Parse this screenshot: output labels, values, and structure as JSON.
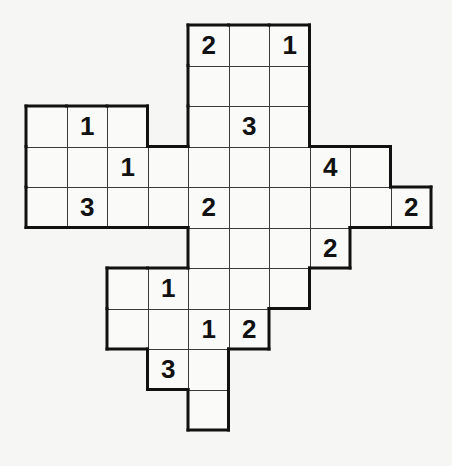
{
  "puzzle": {
    "type": "number-grid-puzzle",
    "cell_size": 40.5,
    "origin_x": 26,
    "origin_y": 25,
    "colors": {
      "background": "#f6f6f4",
      "cell": "#fafaf8",
      "grid_line": "#3a3a3a",
      "outline": "#111111",
      "digit": "#111111"
    },
    "rows": [
      {
        "row": 0,
        "cells": [
          {
            "col": 4,
            "value": "2"
          },
          {
            "col": 5,
            "value": ""
          },
          {
            "col": 6,
            "value": "1"
          }
        ]
      },
      {
        "row": 1,
        "cells": [
          {
            "col": 4,
            "value": ""
          },
          {
            "col": 5,
            "value": ""
          },
          {
            "col": 6,
            "value": ""
          }
        ]
      },
      {
        "row": 2,
        "cells": [
          {
            "col": 0,
            "value": ""
          },
          {
            "col": 1,
            "value": "1"
          },
          {
            "col": 2,
            "value": ""
          },
          {
            "col": 4,
            "value": ""
          },
          {
            "col": 5,
            "value": "3"
          },
          {
            "col": 6,
            "value": ""
          }
        ]
      },
      {
        "row": 3,
        "cells": [
          {
            "col": 0,
            "value": ""
          },
          {
            "col": 1,
            "value": ""
          },
          {
            "col": 2,
            "value": "1"
          },
          {
            "col": 3,
            "value": ""
          },
          {
            "col": 4,
            "value": ""
          },
          {
            "col": 5,
            "value": ""
          },
          {
            "col": 6,
            "value": ""
          },
          {
            "col": 7,
            "value": "4"
          },
          {
            "col": 8,
            "value": ""
          }
        ]
      },
      {
        "row": 4,
        "cells": [
          {
            "col": 0,
            "value": ""
          },
          {
            "col": 1,
            "value": "3"
          },
          {
            "col": 2,
            "value": ""
          },
          {
            "col": 3,
            "value": ""
          },
          {
            "col": 4,
            "value": "2"
          },
          {
            "col": 5,
            "value": ""
          },
          {
            "col": 6,
            "value": ""
          },
          {
            "col": 7,
            "value": ""
          },
          {
            "col": 8,
            "value": ""
          },
          {
            "col": 9,
            "value": "2"
          }
        ]
      },
      {
        "row": 5,
        "cells": [
          {
            "col": 4,
            "value": ""
          },
          {
            "col": 5,
            "value": ""
          },
          {
            "col": 6,
            "value": ""
          },
          {
            "col": 7,
            "value": "2"
          }
        ]
      },
      {
        "row": 6,
        "cells": [
          {
            "col": 2,
            "value": ""
          },
          {
            "col": 3,
            "value": "1"
          },
          {
            "col": 4,
            "value": ""
          },
          {
            "col": 5,
            "value": ""
          },
          {
            "col": 6,
            "value": ""
          }
        ]
      },
      {
        "row": 7,
        "cells": [
          {
            "col": 2,
            "value": ""
          },
          {
            "col": 3,
            "value": ""
          },
          {
            "col": 4,
            "value": "1"
          },
          {
            "col": 5,
            "value": "2"
          }
        ]
      },
      {
        "row": 8,
        "cells": [
          {
            "col": 3,
            "value": "3"
          },
          {
            "col": 4,
            "value": ""
          }
        ]
      },
      {
        "row": 9,
        "cells": [
          {
            "col": 4,
            "value": ""
          }
        ]
      }
    ]
  }
}
